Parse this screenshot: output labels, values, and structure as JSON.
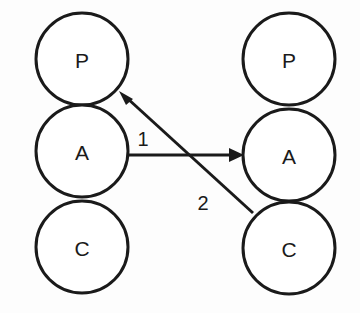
{
  "diagram": {
    "background_color": "#fdfdfd",
    "stroke_color": "#1a1a1a",
    "fill_color": "#ffffff",
    "stroke_width": 3,
    "node_radius": 46,
    "columns": [
      {
        "name": "left-column",
        "cx": 82,
        "nodes": [
          {
            "id": "left-p",
            "label": "P",
            "cx": 82,
            "cy": 59
          },
          {
            "id": "left-a",
            "label": "A",
            "cx": 82,
            "cy": 151
          },
          {
            "id": "left-c",
            "label": "C",
            "cx": 82,
            "cy": 247
          }
        ]
      },
      {
        "name": "right-column",
        "cx": 289,
        "nodes": [
          {
            "id": "right-p",
            "label": "P",
            "cx": 289,
            "cy": 59
          },
          {
            "id": "right-a",
            "label": "A",
            "cx": 289,
            "cy": 155
          },
          {
            "id": "right-c",
            "label": "C",
            "cx": 289,
            "cy": 248
          }
        ]
      }
    ],
    "edges": [
      {
        "id": "edge-1",
        "label": "1",
        "from": "left-a",
        "to": "right-a",
        "x1": 128,
        "y1": 155,
        "x2": 243,
        "y2": 155,
        "label_x": 143,
        "label_y": 139,
        "arrow": "end"
      },
      {
        "id": "edge-2",
        "label": "2",
        "from": "right-c",
        "to": "left-p",
        "x1": 253,
        "y1": 213,
        "x2": 119,
        "y2": 91,
        "label_x": 203,
        "label_y": 203,
        "arrow": "end"
      }
    ]
  }
}
